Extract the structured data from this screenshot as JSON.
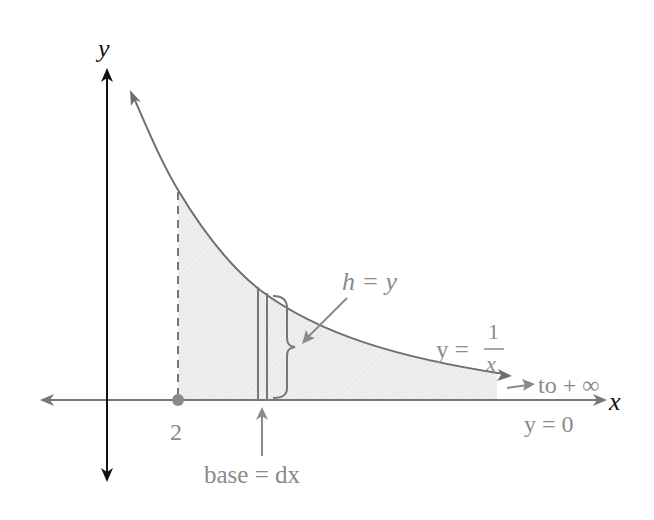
{
  "diagram": {
    "axes": {
      "x_label": "x",
      "y_label": "y"
    },
    "curve": {
      "equation_lhs": "y =",
      "equation_num": "1",
      "equation_den": "x"
    },
    "labels": {
      "start_tick": "2",
      "height": "h = y",
      "base": "base = dx",
      "to_infinity": "to + ∞",
      "asymptote": "y = 0"
    },
    "colors": {
      "axis_y": "#111111",
      "axis_x": "#777777",
      "curve": "#6f6f6f",
      "shade": "#ececec",
      "label": "#8a8a8a"
    }
  }
}
